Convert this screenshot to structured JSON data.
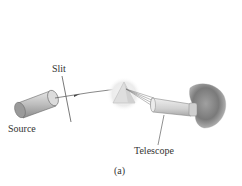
{
  "figure": {
    "caption": "(a)",
    "labels": {
      "slit": "Slit",
      "source": "Source",
      "telescope": "Telescope"
    },
    "components": [
      {
        "name": "source",
        "shape": "cylinder-light-source"
      },
      {
        "name": "slit",
        "shape": "thin-line"
      },
      {
        "name": "prism",
        "shape": "triangular-prism"
      },
      {
        "name": "telescope",
        "shape": "tapered-tube"
      },
      {
        "name": "eye",
        "shape": "observer-head"
      }
    ],
    "colors": {
      "line": "#555555",
      "prism_glow": "#e8e8e8",
      "prism_fill": "#d8d8d8",
      "eye_fill": "#8a8a8a",
      "text": "#333333"
    }
  }
}
